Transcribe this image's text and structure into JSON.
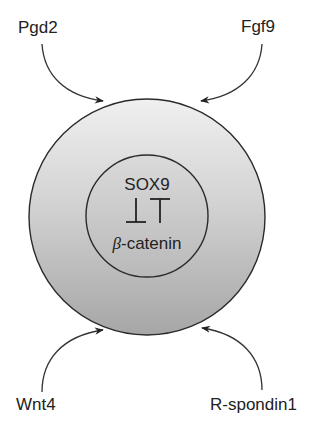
{
  "diagram": {
    "signals": [
      {
        "id": "pgd2",
        "label": "Pgd2",
        "position": "top-left"
      },
      {
        "id": "fgf9",
        "label": "Fgf9",
        "position": "top-right"
      },
      {
        "id": "wnt4",
        "label": "Wnt4",
        "position": "bottom-left"
      },
      {
        "id": "rspondin1",
        "label": "R-spondin1",
        "position": "bottom-right"
      }
    ],
    "core": {
      "top_factor": "SOX9",
      "antagonism_symbol": "⊥T",
      "bottom_factor_greek": "β",
      "bottom_factor_rest": "-catenin"
    },
    "colors": {
      "outer_top": "#efefef",
      "outer_bottom": "#a9a9a9",
      "inner_top": "#d9d9d9",
      "inner_bottom": "#b8b8b8",
      "stroke": "#2a2a2a",
      "text": "#222222"
    }
  }
}
